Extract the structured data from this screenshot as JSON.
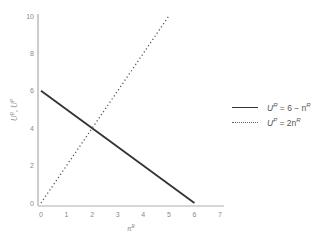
{
  "chart_data": {
    "type": "line",
    "title": "",
    "xlabel": "n^R",
    "ylabel": "U^R, U^P",
    "xlim": [
      0,
      7
    ],
    "ylim": [
      0,
      10
    ],
    "x_ticks": [
      "0",
      "1",
      "2",
      "3",
      "4",
      "5",
      "6",
      "7"
    ],
    "y_ticks": [
      "0",
      "2",
      "4",
      "6",
      "8",
      "10"
    ],
    "grid": false,
    "legend_position": "right",
    "series": [
      {
        "name": "U^R = 6 − n^R",
        "label_parts": {
          "var": "U",
          "sup": "R",
          "rhs": "= 6 − n",
          "rhs_sup": "R"
        },
        "style": "solid",
        "color": "#333333",
        "x": [
          0,
          6
        ],
        "y": [
          6,
          0
        ]
      },
      {
        "name": "U^P = 2n^R",
        "label_parts": {
          "var": "U",
          "sup": "P",
          "rhs": "= 2n",
          "rhs_sup": "R"
        },
        "style": "dotted",
        "color": "#555555",
        "x": [
          0,
          5
        ],
        "y": [
          0,
          10
        ]
      }
    ]
  },
  "axis": {
    "x_label_main": "n",
    "x_label_sup": "R",
    "y_label": "U",
    "y_label_sup1": "R",
    "y_label_sep": ", U",
    "y_label_sup2": "P"
  }
}
